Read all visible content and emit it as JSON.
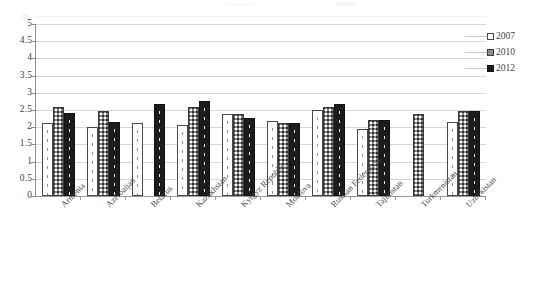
{
  "chart_data": {
    "type": "bar",
    "title": "",
    "subtitle": "",
    "xlabel": "",
    "ylabel": "",
    "ylim": [
      0,
      5
    ],
    "ytick_step": 0.5,
    "yticks": [
      "5",
      "4.5",
      "4",
      "3.5",
      "3",
      "2.5",
      "2",
      "1.5",
      "1",
      "0.5",
      "0"
    ],
    "grid": true,
    "legend_position": "right",
    "categories": [
      "Armenia",
      "Azerbaijan",
      "Belarus",
      "Kazakhstan",
      "Kyrgyz Republic",
      "Moldova",
      "Russian Federation",
      "Tajikistan",
      "Turkmenistan",
      "Uzbekistan"
    ],
    "series": [
      {
        "name": "2007",
        "values": [
          2.12,
          2.02,
          2.13,
          2.07,
          2.37,
          2.17,
          2.5,
          1.95,
          null,
          2.15
        ]
      },
      {
        "name": "2010",
        "values": [
          2.6,
          2.48,
          null,
          2.6,
          2.38,
          2.12,
          2.58,
          2.22,
          2.38,
          2.48
        ]
      },
      {
        "name": "2012",
        "values": [
          2.42,
          2.15,
          2.68,
          2.75,
          2.27,
          2.12,
          2.68,
          2.22,
          null,
          2.48
        ]
      }
    ]
  },
  "legend": {
    "items": [
      {
        "label": "2007",
        "swatch": "white-dotted",
        "color": "#ffffff"
      },
      {
        "label": "2010",
        "swatch": "gray-checker",
        "color": "#8e8e8e"
      },
      {
        "label": "2012",
        "swatch": "black-dotted",
        "color": "#1c1c1c"
      }
    ]
  },
  "axis": {
    "gridline_color": "#d6d6d6",
    "axis_color": "#8d8d8d",
    "background": "#ffffff"
  }
}
